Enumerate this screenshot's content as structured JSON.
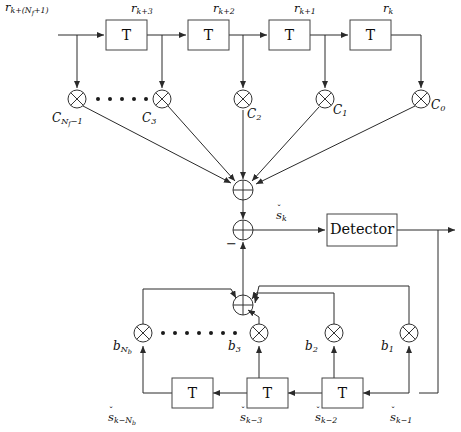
{
  "figure": {
    "type": "block-diagram",
    "colors": {
      "background": "#ffffff",
      "wire": "#2a2a2a",
      "box_stroke": "#444444",
      "text": "#0d0d0d"
    }
  },
  "feedforward": {
    "input_label": "r",
    "input_sub": "k+(N",
    "taps": [
      {
        "signal_base": "r",
        "signal_sub": "k+(N",
        "signal_sub2": "f",
        "signal_sub3": "+1)"
      },
      {
        "signal_base": "r",
        "signal_sub": "k+3"
      },
      {
        "signal_base": "r",
        "signal_sub": "k+2"
      },
      {
        "signal_base": "r",
        "signal_sub": "k+1"
      },
      {
        "signal_base": "r",
        "signal_sub": "k"
      }
    ],
    "delay_label": "T",
    "delay_boxes": [
      {
        "label": "T"
      },
      {
        "label": "T"
      },
      {
        "label": "T"
      },
      {
        "label": "T"
      }
    ],
    "coefficients": [
      {
        "base": "C",
        "sub": "N",
        "sub2": "f",
        "sub3": "−1"
      },
      {
        "base": "C",
        "sub": "3"
      },
      {
        "base": "C",
        "sub": "2"
      },
      {
        "base": "C",
        "sub": "1"
      },
      {
        "base": "C",
        "sub": "0"
      }
    ],
    "multiplier_icon": "multiply-icon",
    "ellipsis_dots": 6
  },
  "summing": {
    "feedforward_adder": {
      "icon": "sum-junction-icon",
      "inputs": 5
    },
    "main_adder": {
      "icon": "sum-junction-icon",
      "inputs": 2,
      "minus_label": "−"
    },
    "feedback_adder": {
      "icon": "sum-junction-icon",
      "inputs": 4
    }
  },
  "detector": {
    "label": "Detector",
    "input_signal_base": "s",
    "input_signal_sub": "k",
    "input_signal_accent": "ˇ"
  },
  "feedback": {
    "coefficients": [
      {
        "base": "b",
        "sub": "N",
        "sub2": "b"
      },
      {
        "base": "b",
        "sub": "3"
      },
      {
        "base": "b",
        "sub": "2"
      },
      {
        "base": "b",
        "sub": "1"
      }
    ],
    "delay_label": "T",
    "delay_boxes": [
      {
        "label": "T"
      },
      {
        "label": "T"
      },
      {
        "label": "T"
      }
    ],
    "signals": [
      {
        "base": "s",
        "accent": "ˇ",
        "sub": "k−N",
        "sub2": "b"
      },
      {
        "base": "s",
        "accent": "ˇ",
        "sub": "k−3"
      },
      {
        "base": "s",
        "accent": "ˇ",
        "sub": "k−2"
      },
      {
        "base": "s",
        "accent": "ˇ",
        "sub": "k−1"
      }
    ],
    "multiplier_icon": "multiply-icon",
    "ellipsis_dots": 9
  }
}
